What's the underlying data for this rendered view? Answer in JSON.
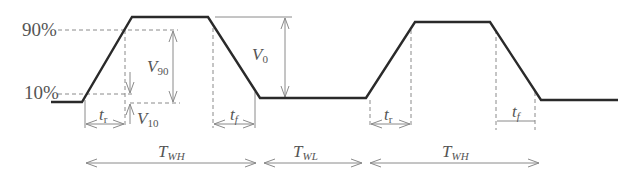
{
  "colors": {
    "waveform": "#2a2a2a",
    "guides": "#8a8a8a",
    "labels": "#555555",
    "background": "#ffffff"
  },
  "levels": {
    "high_pct": "90%",
    "low_pct": "10%"
  },
  "labels": {
    "V90_main": "V",
    "V90_sub": "90",
    "V10_main": "V",
    "V10_sub": "10",
    "V0_main": "V",
    "V0_sub": "0",
    "tr_main": "t",
    "tr_sub": "r",
    "tf_main": "t",
    "tf_sub": "f",
    "TWH_main": "T",
    "TWH_sub": "WH",
    "TWL_main": "T",
    "TWL_sub": "WL"
  },
  "periods": [
    {
      "name": "T_WH",
      "label": "T",
      "sub": "WH"
    },
    {
      "name": "T_WL",
      "label": "T",
      "sub": "WL"
    },
    {
      "name": "T_WH",
      "label": "T",
      "sub": "WH"
    }
  ]
}
